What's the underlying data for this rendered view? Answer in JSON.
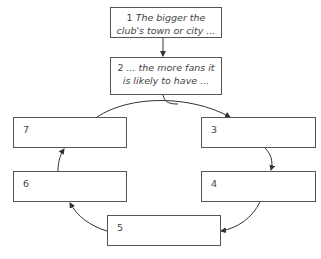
{
  "diagram": {
    "type": "cycle-flowchart",
    "boxes": [
      {
        "id": "1",
        "number": "1",
        "text": "The bigger the club's town or city ..."
      },
      {
        "id": "2",
        "number": "2",
        "text": "... the more fans it is likely to have ..."
      },
      {
        "id": "3",
        "number": "3",
        "text": ""
      },
      {
        "id": "4",
        "number": "4",
        "text": ""
      },
      {
        "id": "5",
        "number": "5",
        "text": ""
      },
      {
        "id": "6",
        "number": "6",
        "text": ""
      },
      {
        "id": "7",
        "number": "7",
        "text": ""
      }
    ],
    "edges": [
      {
        "from": "1",
        "to": "2"
      },
      {
        "from": "2",
        "to": "3"
      },
      {
        "from": "3",
        "to": "4"
      },
      {
        "from": "4",
        "to": "5"
      },
      {
        "from": "5",
        "to": "6"
      },
      {
        "from": "6",
        "to": "7"
      },
      {
        "from": "7",
        "to": "3"
      }
    ]
  }
}
